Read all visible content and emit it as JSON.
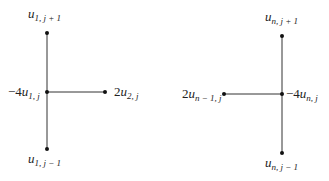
{
  "diagram": {
    "left_stencil": {
      "top": {
        "coef": "",
        "var": "u",
        "sub": "1, j + 1"
      },
      "center": {
        "coef": "−4",
        "var": "u",
        "sub": "1, j"
      },
      "right": {
        "coef": "2",
        "var": "u",
        "sub": "2, j"
      },
      "bottom": {
        "coef": "",
        "var": "u",
        "sub": "1, j − 1"
      }
    },
    "right_stencil": {
      "top": {
        "coef": "",
        "var": "u",
        "sub": "n, j + 1"
      },
      "center": {
        "coef": "−4",
        "var": "u",
        "sub": "n, j"
      },
      "left": {
        "coef": "2",
        "var": "u",
        "sub": "n − 1, j"
      },
      "bottom": {
        "coef": "",
        "var": "u",
        "sub": "n, j − 1"
      }
    },
    "colors": {
      "line": "#333333",
      "node": "#111111",
      "text": "#222222",
      "background": "#ffffff"
    }
  }
}
